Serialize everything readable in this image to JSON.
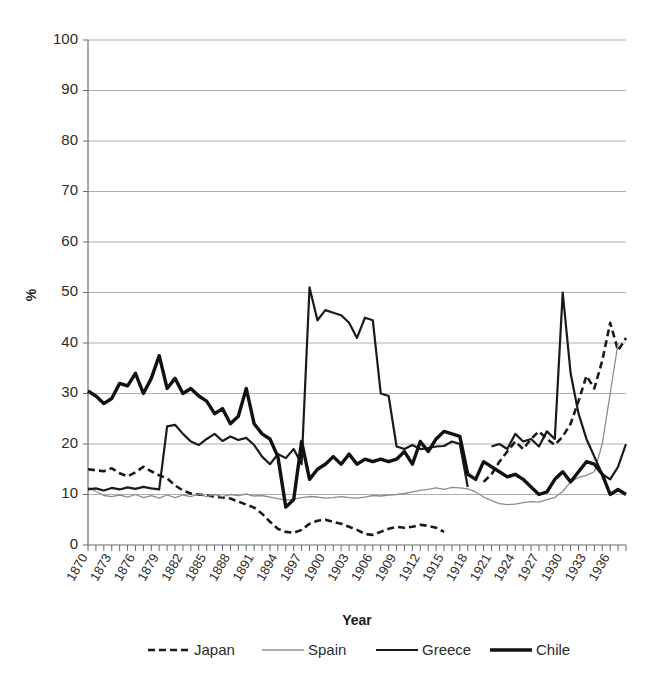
{
  "chart_data": {
    "type": "line",
    "title": "",
    "xlabel": "Year",
    "ylabel": "%",
    "ylim": [
      0,
      100
    ],
    "xlim": [
      1870,
      1938
    ],
    "ytick_values": [
      0,
      10,
      20,
      30,
      40,
      50,
      60,
      70,
      80,
      90,
      100
    ],
    "ytick_labels": [
      "0",
      "10",
      "20",
      "30",
      "40",
      "50",
      "60",
      "70",
      "80",
      "90",
      "100"
    ],
    "xtick_labels": [
      "1870",
      "1873",
      "1876",
      "1879",
      "1882",
      "1885",
      "1888",
      "1891",
      "1894",
      "1897",
      "1900",
      "1903",
      "1906",
      "1909",
      "1912",
      "1915",
      "1918",
      "1921",
      "1924",
      "1927",
      "1930",
      "1933",
      "1936"
    ],
    "xtick_values": [
      1870,
      1873,
      1876,
      1879,
      1882,
      1885,
      1888,
      1891,
      1894,
      1897,
      1900,
      1903,
      1906,
      1909,
      1912,
      1915,
      1918,
      1921,
      1924,
      1927,
      1930,
      1933,
      1936
    ],
    "grid": "horizontal",
    "legend_position": "bottom",
    "series": [
      {
        "name": "Japan",
        "style": "dashed",
        "color": "#1a1a1a",
        "width": 2.6,
        "dash": "7,4",
        "x": [
          1870,
          1871,
          1872,
          1873,
          1874,
          1875,
          1876,
          1877,
          1878,
          1879,
          1880,
          1881,
          1882,
          1883,
          1884,
          1885,
          1886,
          1887,
          1888,
          1889,
          1890,
          1891,
          1892,
          1893,
          1894,
          1895,
          1896,
          1897,
          1898,
          1899,
          1900,
          1901,
          1902,
          1903,
          1904,
          1905,
          1906,
          1907,
          1908,
          1909,
          1910,
          1911,
          1912,
          1913,
          1914,
          1915,
          1920,
          1921,
          1922,
          1923,
          1924,
          1925,
          1926,
          1927,
          1928,
          1929,
          1930,
          1931,
          1932,
          1933,
          1934,
          1935,
          1936,
          1937,
          1938
        ],
        "values": [
          15.0,
          14.8,
          14.6,
          15.2,
          14.2,
          13.6,
          14.4,
          15.5,
          14.6,
          13.8,
          13.2,
          11.8,
          10.8,
          10.2,
          10.0,
          9.8,
          9.6,
          9.4,
          9.2,
          8.6,
          8.0,
          7.4,
          6.2,
          4.6,
          3.2,
          2.6,
          2.4,
          3.0,
          4.2,
          4.8,
          5.0,
          4.6,
          4.2,
          3.6,
          3.0,
          2.2,
          2.0,
          2.6,
          3.2,
          3.6,
          3.4,
          3.6,
          4.0,
          3.8,
          3.4,
          2.6,
          12.5,
          14.0,
          16.5,
          18.5,
          20.5,
          19.0,
          21.0,
          22.5,
          21.0,
          19.8,
          21.5,
          24.0,
          28.5,
          33.5,
          31.0,
          36.5,
          44.0,
          38.5,
          41.0
        ]
      },
      {
        "name": "Spain",
        "style": "thin",
        "color": "#8c8c8c",
        "width": 1.3,
        "dash": "",
        "x": [
          1870,
          1871,
          1872,
          1873,
          1874,
          1875,
          1876,
          1877,
          1878,
          1879,
          1880,
          1881,
          1882,
          1883,
          1884,
          1885,
          1886,
          1887,
          1888,
          1889,
          1890,
          1891,
          1892,
          1893,
          1894,
          1895,
          1896,
          1897,
          1898,
          1899,
          1900,
          1901,
          1902,
          1903,
          1904,
          1905,
          1906,
          1907,
          1908,
          1909,
          1910,
          1911,
          1912,
          1913,
          1914,
          1915,
          1916,
          1917,
          1918,
          1919,
          1920,
          1921,
          1922,
          1923,
          1924,
          1925,
          1926,
          1927,
          1928,
          1929,
          1930,
          1931,
          1932,
          1933,
          1934,
          1935,
          1936,
          1937
        ],
        "values": [
          11.5,
          10.6,
          9.8,
          9.6,
          9.9,
          9.5,
          10.0,
          9.4,
          9.8,
          9.3,
          9.9,
          9.4,
          9.9,
          9.6,
          10.1,
          9.6,
          10.0,
          9.6,
          10.0,
          9.8,
          10.1,
          9.7,
          9.8,
          9.5,
          9.2,
          8.9,
          9.1,
          9.4,
          9.6,
          9.5,
          9.3,
          9.4,
          9.6,
          9.4,
          9.3,
          9.5,
          9.8,
          9.7,
          9.9,
          10.0,
          10.2,
          10.5,
          10.8,
          11.0,
          11.3,
          11.0,
          11.4,
          11.3,
          11.1,
          10.5,
          9.5,
          8.8,
          8.2,
          8.0,
          8.1,
          8.4,
          8.6,
          8.5,
          9.0,
          9.4,
          10.6,
          12.5,
          13.4,
          13.8,
          14.5,
          20.0,
          30.0,
          40.0
        ]
      },
      {
        "name": "Greece",
        "style": "medium",
        "color": "#1a1a1a",
        "width": 2.2,
        "dash": "",
        "x": [
          1870,
          1871,
          1872,
          1873,
          1874,
          1875,
          1876,
          1877,
          1878,
          1879,
          1880,
          1881,
          1882,
          1883,
          1884,
          1885,
          1886,
          1887,
          1888,
          1889,
          1890,
          1891,
          1892,
          1893,
          1894,
          1895,
          1896,
          1897,
          1898,
          1899,
          1900,
          1901,
          1902,
          1903,
          1904,
          1905,
          1906,
          1907,
          1908,
          1909,
          1910,
          1911,
          1912,
          1913,
          1914,
          1915,
          1916,
          1917,
          1918,
          1921,
          1922,
          1923,
          1924,
          1925,
          1926,
          1927,
          1928,
          1929,
          1930,
          1931,
          1932,
          1933,
          1934,
          1935,
          1936,
          1937,
          1938
        ],
        "values": [
          11.0,
          11.2,
          10.8,
          11.3,
          11.0,
          11.4,
          11.1,
          11.5,
          11.2,
          11.0,
          23.5,
          23.8,
          22.0,
          20.5,
          19.8,
          21.0,
          22.0,
          20.6,
          21.5,
          20.8,
          21.2,
          19.8,
          17.5,
          16.0,
          18.0,
          17.2,
          19.0,
          16.0,
          51.0,
          44.5,
          46.5,
          46.0,
          45.5,
          44.0,
          41.0,
          45.0,
          44.5,
          30.0,
          29.5,
          19.5,
          19.0,
          19.8,
          19.0,
          19.2,
          19.5,
          19.6,
          20.5,
          20.0,
          11.5,
          19.5,
          20.0,
          19.0,
          22.0,
          20.5,
          21.0,
          19.5,
          22.5,
          21.0,
          50.0,
          34.0,
          26.0,
          21.0,
          17.5,
          14.0,
          13.0,
          15.5,
          20.0
        ]
      },
      {
        "name": "Chile",
        "style": "thick",
        "color": "#111111",
        "width": 3.4,
        "dash": "",
        "x": [
          1870,
          1871,
          1872,
          1873,
          1874,
          1875,
          1876,
          1877,
          1878,
          1879,
          1880,
          1881,
          1882,
          1883,
          1884,
          1885,
          1886,
          1887,
          1888,
          1889,
          1890,
          1891,
          1892,
          1893,
          1894,
          1895,
          1896,
          1897,
          1898,
          1899,
          1900,
          1901,
          1902,
          1903,
          1904,
          1905,
          1906,
          1907,
          1908,
          1909,
          1910,
          1911,
          1912,
          1913,
          1914,
          1915,
          1916,
          1917,
          1918,
          1919,
          1920,
          1921,
          1922,
          1923,
          1924,
          1925,
          1926,
          1927,
          1928,
          1929,
          1930,
          1931,
          1932,
          1933,
          1934,
          1935,
          1936,
          1937,
          1938
        ],
        "values": [
          30.5,
          29.5,
          28.0,
          29.0,
          32.0,
          31.5,
          34.0,
          30.0,
          33.0,
          37.5,
          31.0,
          33.0,
          30.0,
          31.0,
          29.5,
          28.5,
          26.0,
          27.0,
          24.0,
          25.5,
          31.0,
          24.0,
          22.0,
          21.0,
          17.5,
          7.5,
          9.0,
          20.5,
          13.0,
          15.0,
          16.0,
          17.5,
          16.0,
          18.0,
          16.0,
          17.0,
          16.5,
          17.0,
          16.5,
          17.0,
          18.5,
          16.0,
          20.5,
          18.5,
          21.0,
          22.5,
          22.0,
          21.5,
          14.0,
          13.0,
          16.5,
          15.5,
          14.5,
          13.5,
          14.0,
          13.0,
          11.5,
          10.0,
          10.5,
          13.0,
          14.5,
          12.5,
          14.5,
          16.5,
          16.0,
          14.0,
          10.0,
          11.0,
          10.0
        ]
      }
    ]
  },
  "legend": {
    "items": [
      {
        "label": "Japan"
      },
      {
        "label": "Spain"
      },
      {
        "label": "Greece"
      },
      {
        "label": "Chile"
      }
    ]
  },
  "axes": {
    "x_title": "Year",
    "y_title": "%"
  }
}
